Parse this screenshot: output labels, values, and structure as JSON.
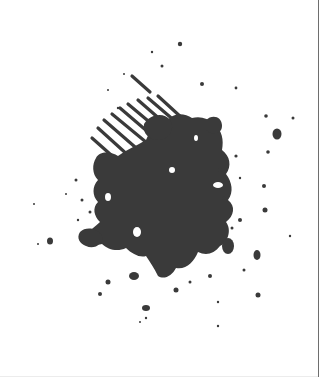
{
  "image": {
    "subject": "grunge ink splatter with diagonal stripes",
    "ink_color": "#3a3a3a",
    "background_color": "#ffffff",
    "border_color": "#6e6e6e"
  }
}
